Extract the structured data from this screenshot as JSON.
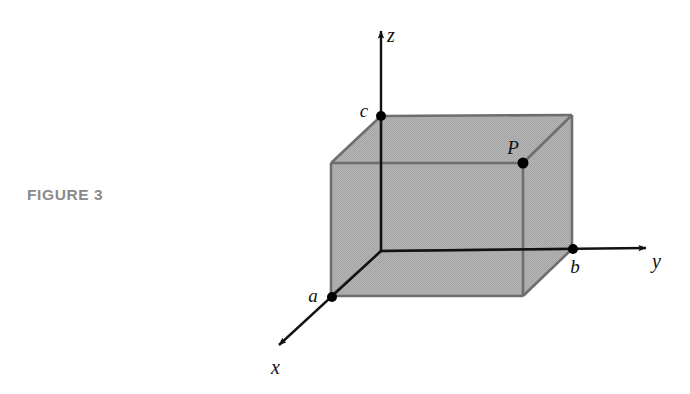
{
  "figure": {
    "caption": "FIGURE 3",
    "caption_color": "#8a8a8a",
    "background_color": "#ffffff"
  },
  "diagram": {
    "type": "3d-coordinate-box",
    "colors": {
      "box_fill": "#b0b0b0",
      "box_edge": "#6e6e6e",
      "axis_line": "#111111",
      "point_marker": "#000000",
      "label_text": "#111111"
    },
    "axes": [
      {
        "id": "x",
        "label": "x",
        "label_x": 277,
        "label_y": 374,
        "arrow_tip_x": 272,
        "arrow_tip_y": 352,
        "origin_x": 381,
        "origin_y": 251
      },
      {
        "id": "y",
        "label": "y",
        "label_x": 652,
        "label_y": 268,
        "arrow_tip_x": 655,
        "arrow_tip_y": 248,
        "origin_x": 381,
        "origin_y": 251
      },
      {
        "id": "z",
        "label": "z",
        "label_x": 387,
        "label_y": 42,
        "arrow_tip_x": 381,
        "arrow_tip_y": 23,
        "origin_x": 381,
        "origin_y": 251
      }
    ],
    "points": [
      {
        "id": "a",
        "label": "a",
        "x": 332,
        "y": 297,
        "label_x": 313,
        "label_y": 302,
        "on_axis": "x",
        "radius": 5
      },
      {
        "id": "b",
        "label": "b",
        "x": 573,
        "y": 249,
        "label_x": 573,
        "label_y": 272,
        "on_axis": "y",
        "radius": 5
      },
      {
        "id": "c",
        "label": "c",
        "x": 381,
        "y": 116,
        "label_x": 360,
        "label_y": 116,
        "on_axis": "z",
        "radius": 5
      },
      {
        "id": "P",
        "label": "P",
        "x": 523,
        "y": 163,
        "label_x": 509,
        "label_y": 153,
        "on_axis": "",
        "radius": 5.5
      }
    ],
    "box": {
      "front_face": [
        [
          331,
          163
        ],
        [
          523,
          163
        ],
        [
          523,
          296
        ],
        [
          331,
          296
        ]
      ],
      "back_face": [
        [
          381,
          116
        ],
        [
          572,
          115
        ],
        [
          572,
          249
        ],
        [
          381,
          251
        ]
      ],
      "note": "front face is the near xz-style face; back face is offset along the x direction"
    }
  }
}
